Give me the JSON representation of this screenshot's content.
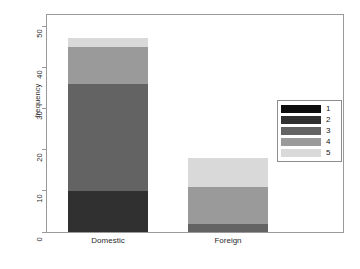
{
  "chart_data": {
    "type": "bar",
    "subtype": "stacked",
    "title": "",
    "xlabel": "",
    "ylabel": "frequency",
    "categories": [
      "Domestic",
      "Foreign"
    ],
    "ylim": [
      0,
      53
    ],
    "yticks": [
      0,
      10,
      20,
      30,
      40,
      50
    ],
    "ytick_labels": [
      "0",
      "10",
      "20",
      "30",
      "40",
      "50"
    ],
    "grid": false,
    "legend": {
      "position": "right",
      "entries": [
        {
          "label": "1",
          "color": "#0d0d0d"
        },
        {
          "label": "2",
          "color": "#303030"
        },
        {
          "label": "3",
          "color": "#636363"
        },
        {
          "label": "4",
          "color": "#9a9a9a"
        },
        {
          "label": "5",
          "color": "#d9d9d9"
        }
      ]
    },
    "series": [
      {
        "name": "1",
        "color": "#0d0d0d",
        "values": [
          0,
          0
        ]
      },
      {
        "name": "2",
        "color": "#303030",
        "values": [
          10,
          0
        ]
      },
      {
        "name": "3",
        "color": "#636363",
        "values": [
          26,
          2
        ]
      },
      {
        "name": "4",
        "color": "#9a9a9a",
        "values": [
          9,
          9
        ]
      },
      {
        "name": "5",
        "color": "#d9d9d9",
        "values": [
          2,
          7
        ]
      }
    ],
    "totals": [
      47,
      18
    ]
  },
  "axis": {
    "y_label": "frequency"
  }
}
